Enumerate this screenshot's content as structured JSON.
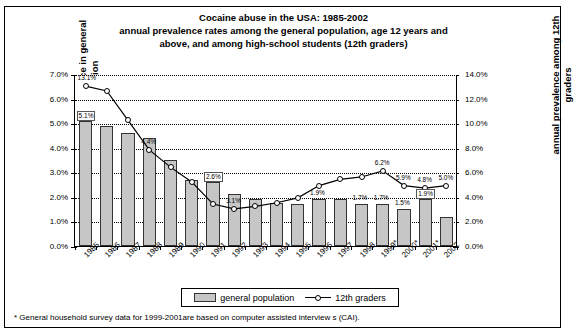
{
  "title": {
    "line1": "Cocaine abuse in the USA: 1985-2002",
    "line2": "annual prevalence rates among the general population, age 12 years and",
    "line3": "above, and among high-school students (12th graders)"
  },
  "axes": {
    "left_title": "annual prevalence in general population",
    "right_title": "annual prevalence among 12th graders",
    "left_ticks": [
      "0.0%",
      "1.0%",
      "2.0%",
      "3.0%",
      "4.0%",
      "5.0%",
      "6.0%",
      "7.0%"
    ],
    "right_ticks": [
      "0.0%",
      "2.0%",
      "4.0%",
      "6.0%",
      "8.0%",
      "10.0%",
      "12.0%",
      "14.0%"
    ]
  },
  "legend": {
    "bar_label": "general population",
    "line_label": "12th graders"
  },
  "footnote": "* General household survey data for 1999-2001are based on computer assisted interview s (CAI).",
  "colors": {
    "bar_fill": "#c6c6c6",
    "bar_stroke": "#333333",
    "line": "#000000",
    "marker_fill": "#ffffff",
    "grid": "#000000"
  },
  "chart_data": {
    "type": "bar",
    "title": "Cocaine abuse in the USA: 1985-2002",
    "subtitle": "annual prevalence rates among the general population, age 12 years and above, and among high-school students (12th graders)",
    "xlabel": "",
    "ylabel": "annual prevalence in general population",
    "y2label": "annual prevalence among 12th graders",
    "ylim": [
      0,
      7
    ],
    "y2lim": [
      0,
      14
    ],
    "grid": true,
    "legend_position": "bottom",
    "categories": [
      "1985",
      "1986",
      "1987",
      "1988",
      "1989",
      "1990",
      "1991",
      "1992",
      "1993",
      "1994",
      "1995",
      "1996",
      "1997",
      "1998",
      "1999*",
      "2000*",
      "2001*",
      "2002"
    ],
    "series": [
      {
        "name": "general population",
        "type": "bar",
        "axis": "left",
        "unit": "%",
        "values": [
          5.1,
          4.9,
          4.6,
          4.4,
          3.5,
          2.7,
          2.6,
          2.1,
          1.9,
          1.75,
          1.7,
          1.9,
          1.9,
          1.7,
          1.7,
          1.5,
          1.9,
          1.2
        ],
        "point_labels": {
          "1985": "5.1%",
          "1991": "2.6%",
          "1996": "1.9%",
          "1998": "1.7%",
          "1999*": "1.7%",
          "2000*": "1.5%",
          "2001*": "1.9%"
        }
      },
      {
        "name": "12th graders",
        "type": "line",
        "axis": "right",
        "unit": "%",
        "values": [
          13.1,
          12.7,
          10.3,
          7.9,
          6.5,
          5.3,
          3.5,
          3.1,
          3.3,
          3.6,
          4.0,
          5.0,
          5.5,
          5.7,
          6.2,
          5.0,
          4.8,
          5.0
        ],
        "point_labels": {
          "1985": "13.1%",
          "1988": "4.4%",
          "1992": "3.1%",
          "1999*": "6.2%",
          "2000*": "5.9%",
          "2001*": "4.8%",
          "2002": "5.0%"
        }
      }
    ]
  }
}
